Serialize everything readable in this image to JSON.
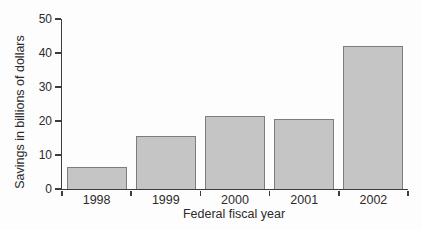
{
  "chart_data": {
    "type": "bar",
    "categories": [
      "1998",
      "1999",
      "2000",
      "2001",
      "2002"
    ],
    "values": [
      6.5,
      15.5,
      21.5,
      20.5,
      42
    ],
    "title": "",
    "xlabel": "Federal fiscal year",
    "ylabel": "Savings in billions of dollars",
    "ylim": [
      0,
      50
    ],
    "y_ticks": [
      0,
      10,
      20,
      30,
      40,
      50
    ],
    "grid": false,
    "legend": false,
    "colors": {
      "bar_fill": "#c5c5c5",
      "bar_border": "#7d7d7d",
      "axis": "#3c3c3c",
      "text": "#2b2b2b",
      "background": "#fdfdfd"
    }
  }
}
